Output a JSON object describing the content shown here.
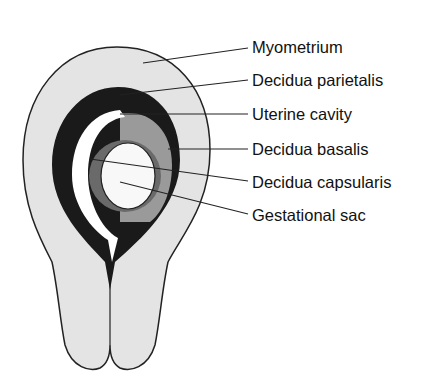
{
  "diagram": {
    "colors": {
      "myometrium": "#e4e4e4",
      "decidua_parietalis": "#1a1a1a",
      "uterine_cavity": "#ffffff",
      "decidua_basalis": "#9a9a9a",
      "decidua_capsularis": "#6a6a6a",
      "gestational_sac": "#f8f8f8",
      "outline": "#222222"
    },
    "labels": [
      {
        "id": "myometrium",
        "text": "Myometrium"
      },
      {
        "id": "decidua-parietalis",
        "text": "Decidua parietalis"
      },
      {
        "id": "uterine-cavity",
        "text": "Uterine cavity"
      },
      {
        "id": "decidua-basalis",
        "text": "Decidua basalis"
      },
      {
        "id": "decidua-capsularis",
        "text": "Decidua capsularis"
      },
      {
        "id": "gestational-sac",
        "text": "Gestational sac"
      }
    ]
  }
}
